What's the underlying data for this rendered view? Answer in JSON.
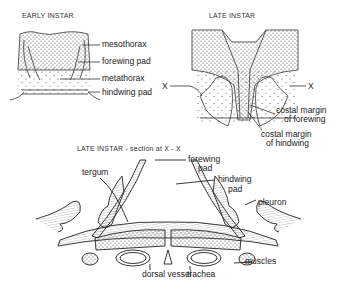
{
  "panels": {
    "early": {
      "title": "EARLY INSTAR",
      "labels": [
        "mesothorax",
        "forewing pad",
        "metathorax",
        "hindwing pad"
      ]
    },
    "late": {
      "title": "LATE INSTAR",
      "x_marker_left": "X",
      "x_marker_right": "X",
      "labels": {
        "costal_forewing_1": "costal margin",
        "costal_forewing_2": "of forewing",
        "costal_hindwing_1": "costal margin",
        "costal_hindwing_2": "of hindwing"
      }
    },
    "section": {
      "title": "LATE INSTAR - section at X - X",
      "labels": {
        "tergum": "tergum",
        "forewing_pad_1": "forewing",
        "forewing_pad_2": "pad",
        "hindwing_pad_1": "hindwing",
        "hindwing_pad_2": "pad",
        "pleuron": "pleuron",
        "muscles": "muscles",
        "dorsal_vessel": "dorsal vessel",
        "trachea": "trachea"
      }
    }
  }
}
